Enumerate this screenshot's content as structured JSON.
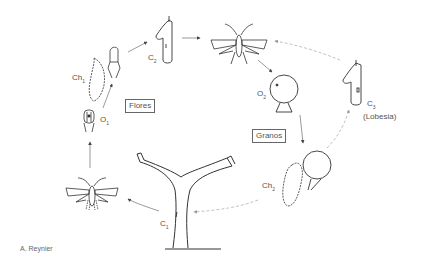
{
  "diagram": {
    "type": "life-cycle",
    "subject": "Lobesia",
    "stages": {
      "c1": {
        "label": "C",
        "sub": "1"
      },
      "o1": {
        "label": "O",
        "sub": "1"
      },
      "ch1": {
        "label": "Ch",
        "sub": "1"
      },
      "c2": {
        "label": "C",
        "sub": "2"
      },
      "o2": {
        "label": "O",
        "sub": "2"
      },
      "ch2": {
        "label": "Ch",
        "sub": "2"
      },
      "c3": {
        "label": "C",
        "sub": "3"
      }
    },
    "c3_note": "(Lobesia)",
    "boxes": {
      "flowers": "Flores",
      "grains": "Granos"
    },
    "credit": "A. Reynier",
    "colors": {
      "line": "#333333",
      "dashed": "#999999",
      "text": "#555555"
    }
  }
}
